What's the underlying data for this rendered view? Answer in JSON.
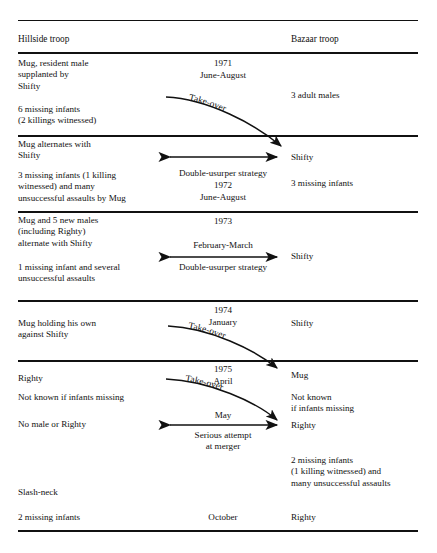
{
  "figure": {
    "columns": {
      "left_header": "Hillside troop",
      "right_header": "Bazaar troop"
    },
    "rules_color": "#111111"
  },
  "rows": [
    {
      "id": "row-1971",
      "left": "Mug, resident male\nsupplanted by\nShifty",
      "left2": "6 missing infants\n(2 killings witnessed)",
      "mid_year": "1971",
      "mid_month": "June-August",
      "mid_arrow_label": "Take-over",
      "right": "3 adult males"
    },
    {
      "id": "row-1972",
      "left": "Mug alternates with\nShifty",
      "left2": "3 missing infants (1 killing\nwitnessed) and many\nunsuccessful assaults by Mug",
      "mid_arrow_label": "Double-usurper strategy",
      "mid_year": "1972",
      "mid_month": "June-August",
      "right": "Shifty",
      "right2": "3 missing infants"
    },
    {
      "id": "row-1973",
      "left": "Mug and 5 new males\n(including Righty)\nalternate with Shifty",
      "left2": "1 missing infant and several\nunsuccessful assaults",
      "mid_year": "1973",
      "mid_month": "February-March",
      "mid_arrow_label": "Double-usurper strategy",
      "right": "Shifty"
    },
    {
      "id": "row-1974",
      "left": "Mug holding his own\nagainst Shifty",
      "mid_year": "1974",
      "mid_month": "January",
      "mid_arrow_label": "Take-over",
      "right": "Shifty"
    },
    {
      "id": "row-1975",
      "left": "Righty",
      "left2": "Not known if infants missing",
      "left3": "No male or Righty",
      "left4": "Slash-neck",
      "left5": "2 missing infants",
      "mid_year": "1975",
      "mid_month_april": "April",
      "mid_arrow_label_takeover": "Take-over",
      "mid_month_may": "May",
      "mid_arrow_label_merger": "Serious attempt\nat merger",
      "mid_month_october": "October",
      "right": "Mug",
      "right2": "Not known\nif infants missing",
      "right3": "Righty",
      "right4": "2 missing infants\n(1 killing witnessed) and\nmany unsuccessful assaults",
      "right5": "Righty"
    }
  ]
}
